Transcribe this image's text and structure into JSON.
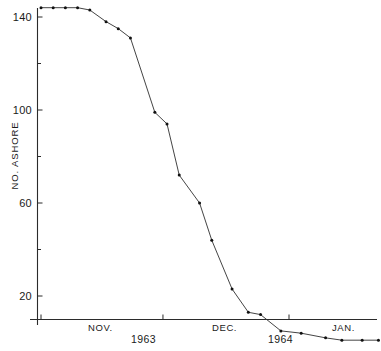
{
  "chart_data": {
    "type": "line",
    "title": "",
    "xlabel": "",
    "ylabel": "NO. ASHORE",
    "ylim": [
      0,
      150
    ],
    "yticks_major": [
      20,
      60,
      100,
      140
    ],
    "yticks_minor": [
      40,
      80,
      120
    ],
    "grid": false,
    "legend": "none",
    "x_axis_ticks": [
      {
        "label": "NOV.",
        "year": "1963"
      },
      {
        "label": "DEC.",
        "year": "1963"
      },
      {
        "label": "JAN.",
        "year": "1964"
      }
    ],
    "x_month_labels": [
      "NOV.",
      "DEC.",
      "JAN."
    ],
    "x_year_labels": [
      "1963",
      "1964"
    ],
    "series": [
      {
        "name": "No. ashore",
        "points": [
          {
            "day": 0,
            "value": 144
          },
          {
            "day": 3,
            "value": 144
          },
          {
            "day": 6,
            "value": 144
          },
          {
            "day": 9,
            "value": 144
          },
          {
            "day": 12,
            "value": 143
          },
          {
            "day": 16,
            "value": 138
          },
          {
            "day": 19,
            "value": 135
          },
          {
            "day": 22,
            "value": 131
          },
          {
            "day": 28,
            "value": 99
          },
          {
            "day": 31,
            "value": 94
          },
          {
            "day": 34,
            "value": 72
          },
          {
            "day": 39,
            "value": 60
          },
          {
            "day": 42,
            "value": 44
          },
          {
            "day": 47,
            "value": 23
          },
          {
            "day": 51,
            "value": 13
          },
          {
            "day": 54,
            "value": 12
          },
          {
            "day": 59,
            "value": 5
          },
          {
            "day": 64,
            "value": 4
          },
          {
            "day": 70,
            "value": 2
          },
          {
            "day": 74,
            "value": 1
          },
          {
            "day": 79,
            "value": 1
          },
          {
            "day": 83,
            "value": 1
          }
        ]
      }
    ]
  },
  "axis": {
    "y_tick_labels": [
      "140",
      "100",
      "60",
      "20"
    ],
    "y_axis_title": "NO. ASHORE",
    "x_tick_month_labels": [
      "NOV.",
      "DEC.",
      "JAN."
    ],
    "x_tick_year_labels": [
      "1963",
      "1964"
    ]
  }
}
